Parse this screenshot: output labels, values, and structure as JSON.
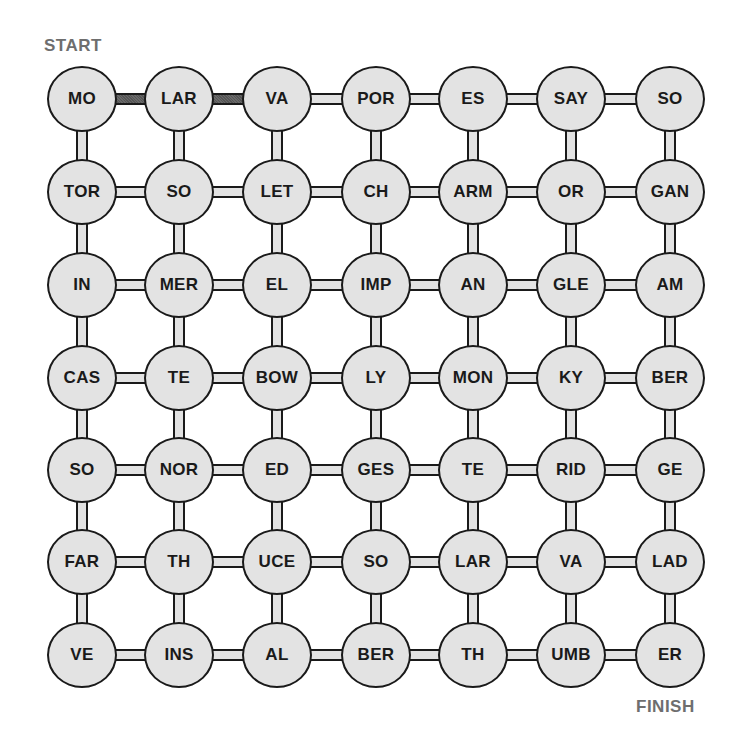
{
  "labels": {
    "start": "START",
    "finish": "FINISH"
  },
  "colors": {
    "node_fill": "#e3e3e3",
    "outline": "#1a1a1a",
    "highlight_connector": "#5b5b5b",
    "label_gray": "#6e6e6e"
  },
  "grid": {
    "rows": 7,
    "cols": 7,
    "cells": [
      [
        "MO",
        "LAR",
        "VA",
        "POR",
        "ES",
        "SAY",
        "SO"
      ],
      [
        "TOR",
        "SO",
        "LET",
        "CH",
        "ARM",
        "OR",
        "GAN"
      ],
      [
        "IN",
        "MER",
        "EL",
        "IMP",
        "AN",
        "GLE",
        "AM"
      ],
      [
        "CAS",
        "TE",
        "BOW",
        "LY",
        "MON",
        "KY",
        "BER"
      ],
      [
        "SO",
        "NOR",
        "ED",
        "GES",
        "TE",
        "RID",
        "GE"
      ],
      [
        "FAR",
        "TH",
        "UCE",
        "SO",
        "LAR",
        "VA",
        "LAD"
      ],
      [
        "VE",
        "INS",
        "AL",
        "BER",
        "TH",
        "UMB",
        "ER"
      ]
    ]
  },
  "highlighted_path": [
    {
      "from": [
        0,
        0
      ],
      "to": [
        0,
        1
      ]
    },
    {
      "from": [
        0,
        1
      ],
      "to": [
        0,
        2
      ]
    }
  ]
}
